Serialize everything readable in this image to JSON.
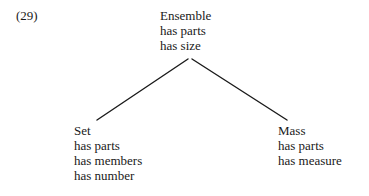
{
  "figure": {
    "example_number": "(29)",
    "stroke_color": "#1a1a1a",
    "background_color": "#ffffff"
  },
  "tree": {
    "root": {
      "label": "Ensemble",
      "attributes": [
        "has parts",
        "has size"
      ]
    },
    "children": [
      {
        "label": "Set",
        "attributes": [
          "has parts",
          "has members",
          "has number"
        ]
      },
      {
        "label": "Mass",
        "attributes": [
          "has parts",
          "has measure"
        ]
      }
    ]
  },
  "branches": [
    {
      "name": "root-to-set",
      "x1": 188,
      "y1": 59,
      "x2": 97,
      "y2": 120
    },
    {
      "name": "root-to-mass",
      "x1": 192,
      "y1": 59,
      "x2": 287,
      "y2": 120
    }
  ]
}
